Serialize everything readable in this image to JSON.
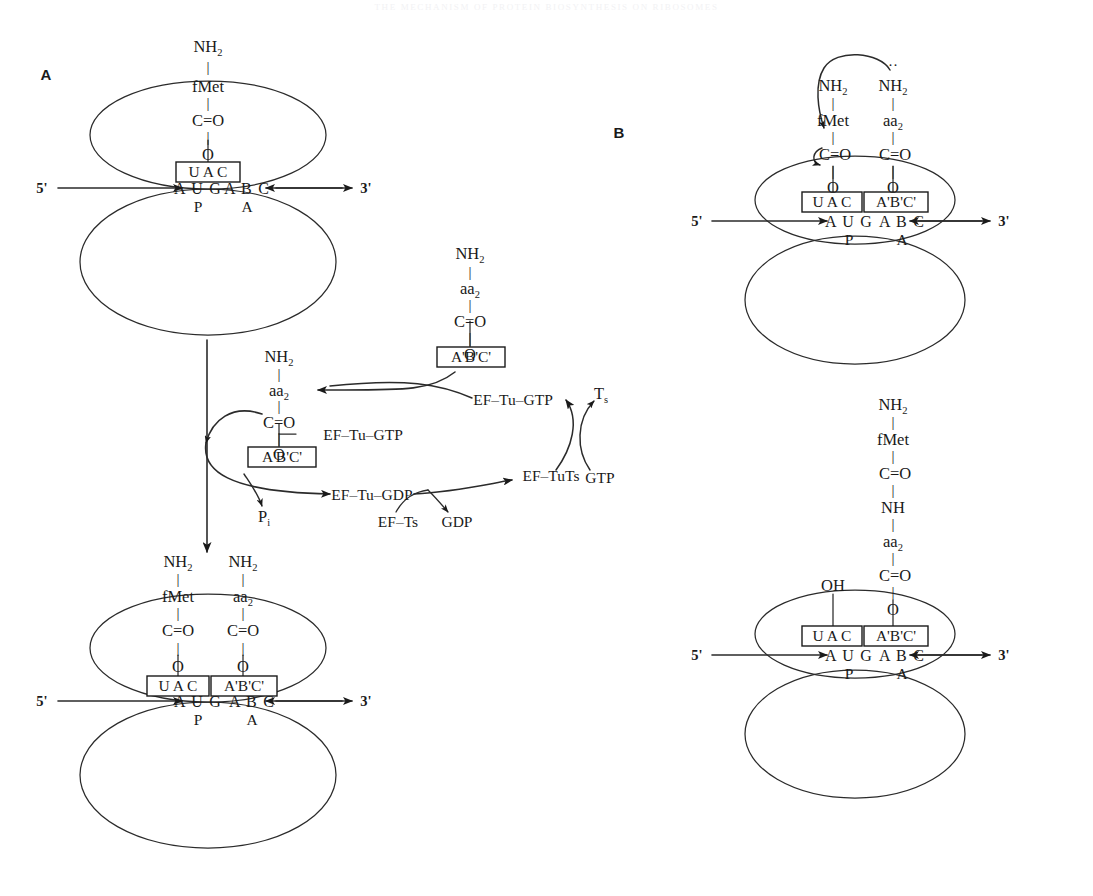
{
  "figure": {
    "running_head": "The Mechanism of Protein Biosynthesis on Ribosomes",
    "panels": [
      {
        "id": "A",
        "label": "A"
      },
      {
        "id": "B",
        "label": "B"
      }
    ]
  },
  "labels": {
    "five_prime": "5'",
    "three_prime": "3'",
    "nh2": "NH",
    "nh2_sub": "2",
    "nh": "NH",
    "oh": "OH",
    "fmet": "fMet",
    "aa2": "aa",
    "aa2_sub": "2",
    "carbonyl": "C=O",
    "oxygen": "O",
    "p_site": "P",
    "a_site": "A",
    "codon_p": "A U G",
    "codon_a": "A B C",
    "anticodon_p": "U A C",
    "anticodon_a": "A'B'C'",
    "bond": "|"
  },
  "panelA": {
    "letter": "A",
    "top_ribosome": {
      "chain": [
        "NH2",
        "fMet",
        "C=O",
        "O"
      ],
      "anticodon": "U A C",
      "mrna": "A U G A B C",
      "codon_p": "A U G",
      "codon_a": "A B C",
      "site_p": "P",
      "site_a": "A",
      "five_prime": "5'",
      "three_prime": "3'"
    },
    "incoming_trna": {
      "chain": [
        "NH2",
        "aa2",
        "C=O",
        "O"
      ],
      "anticodon": "A'B'C'"
    },
    "bound_trna": {
      "chain": [
        "NH2",
        "aa2",
        "C=O",
        "O"
      ],
      "anticodon": "A'B'C'",
      "factor": "EF–Tu–GTP"
    },
    "cycle": {
      "ef_tu_gtp": "EF–Tu–GTP",
      "ef_tu_gdp": "EF–Tu–GDP",
      "ef_ts": "EF–Ts",
      "ef_tuts": "EF–TuTs",
      "gtp": "GTP",
      "gdp": "GDP",
      "ts": "T",
      "ts_sub": "s",
      "pi": "P",
      "pi_sub": "i"
    },
    "bottom_ribosome": {
      "chain_p": [
        "NH2",
        "fMet",
        "C=O",
        "O"
      ],
      "chain_a": [
        "NH2",
        "aa2",
        "C=O",
        "O"
      ],
      "anticodon_p": "U A C",
      "anticodon_a": "A'B'C'",
      "codon_p": "A U G",
      "codon_a": "A B C",
      "site_p": "P",
      "site_a": "A",
      "five_prime": "5'",
      "three_prime": "3'"
    }
  },
  "panelB": {
    "letter": "B",
    "top_ribosome": {
      "chain_p": [
        "NH2",
        "fMet",
        "C=O",
        "O"
      ],
      "chain_a": [
        "NH2",
        "aa2",
        "C=O",
        "O"
      ],
      "anticodon_p": "U A C",
      "anticodon_a": "A'B'C'",
      "codon_p": "A U G",
      "codon_a": "A B C",
      "site_p": "P",
      "site_a": "A",
      "five_prime": "5'",
      "three_prime": "3'"
    },
    "bottom_ribosome": {
      "dipeptide": [
        "NH2",
        "fMet",
        "C=O",
        "NH",
        "aa2",
        "C=O",
        "O"
      ],
      "deacylated": "OH",
      "anticodon_p": "U A C",
      "anticodon_a": "A'B'C'",
      "codon_p": "A U G",
      "codon_a": "A B C",
      "site_p": "P",
      "site_a": "A",
      "five_prime": "5'",
      "three_prime": "3'"
    }
  },
  "colors": {
    "ink": "#1a1a1a",
    "line": "#2b2b2b",
    "background": "#ffffff",
    "runhead": "#f2f2f4"
  }
}
